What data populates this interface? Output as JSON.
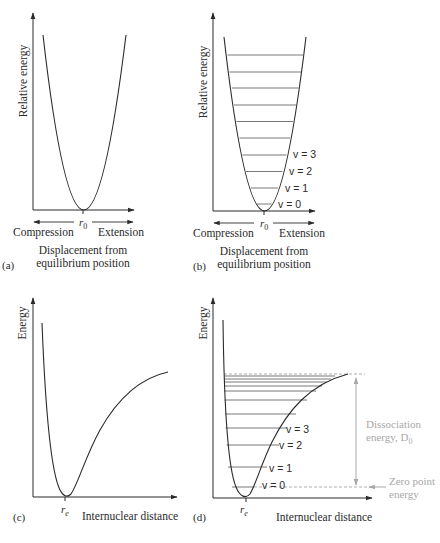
{
  "panels": {
    "a": {
      "tag": "(a)",
      "y_axis_label": "Relative energy",
      "x_marker": "r",
      "x_marker_sub": "0",
      "left_direction": "Compression",
      "right_direction": "Extension",
      "x_caption_line1": "Displacement from",
      "x_caption_line2": "equilibrium position"
    },
    "b": {
      "tag": "(b)",
      "y_axis_label": "Relative energy",
      "x_marker": "r",
      "x_marker_sub": "0",
      "left_direction": "Compression",
      "right_direction": "Extension",
      "x_caption_line1": "Displacement from",
      "x_caption_line2": "equilibrium position",
      "level_labels": [
        "v = 0",
        "v = 1",
        "v = 2",
        "v = 3"
      ],
      "level_count": 10
    },
    "c": {
      "tag": "(c)",
      "y_axis_label": "Energy",
      "x_marker": "r",
      "x_marker_sub": "e",
      "x_caption": "Internuclear distance"
    },
    "d": {
      "tag": "(d)",
      "y_axis_label": "Energy",
      "x_marker": "r",
      "x_marker_sub": "e",
      "x_caption": "Internuclear distance",
      "level_labels": [
        "v = 0",
        "v = 1",
        "v = 2",
        "v = 3"
      ],
      "dissociation_line1": "Dissociation",
      "dissociation_line2": "energy, D",
      "dissociation_sub": "0",
      "zero_point_line1": "Zero point",
      "zero_point_line2": "energy"
    }
  },
  "colors": {
    "ink": "#2a2a2a",
    "annotation": "#a8a8a8",
    "background": "#ffffff"
  }
}
